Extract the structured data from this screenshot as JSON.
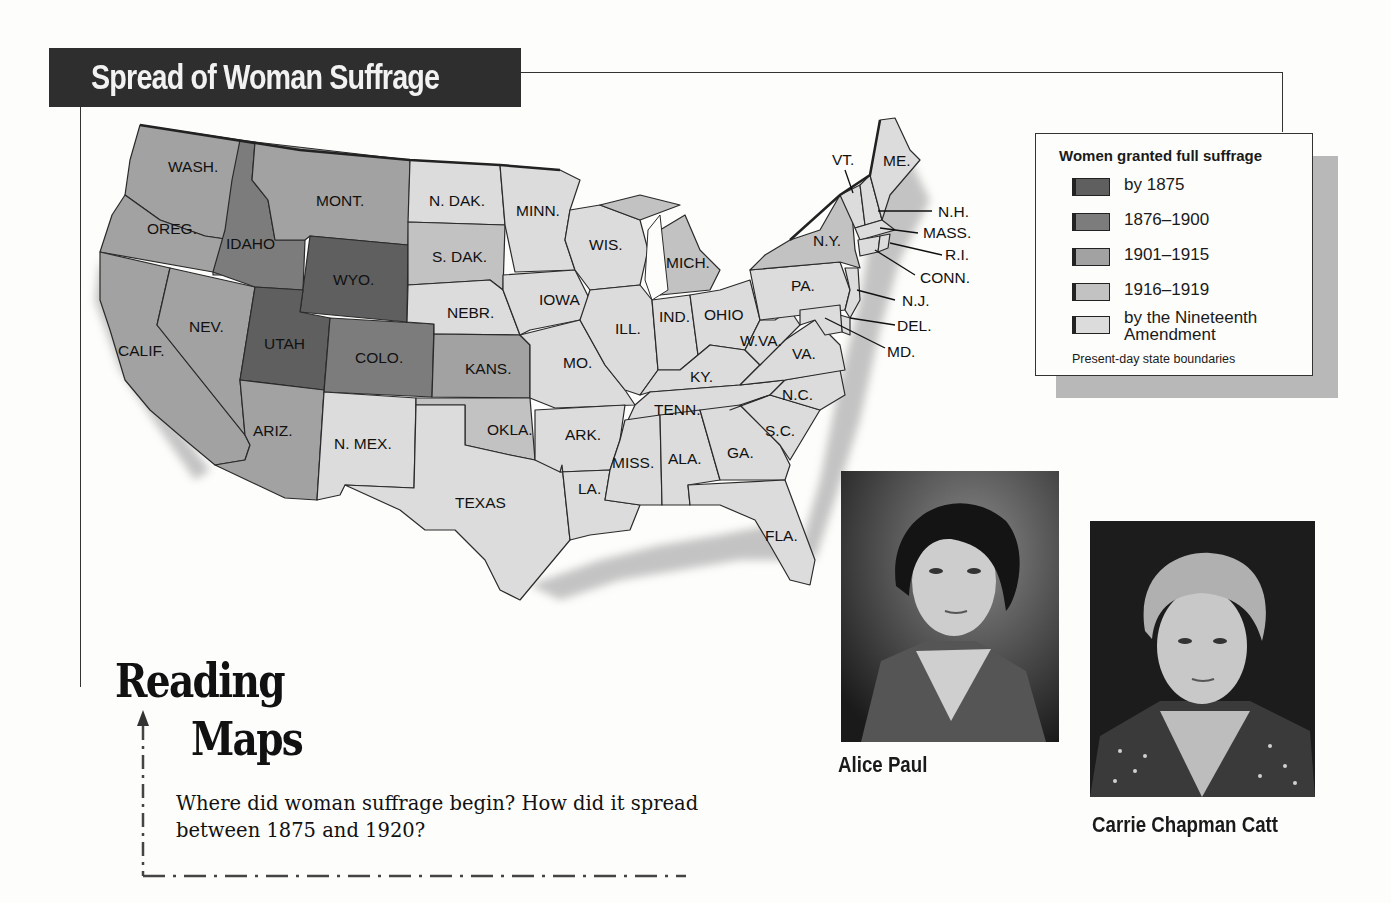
{
  "title": "Spread of Woman Suffrage",
  "legend": {
    "title": "Women granted full suffrage",
    "items": [
      {
        "label": "by 1875",
        "color": "#5f5f5f"
      },
      {
        "label": "1876–1900",
        "color": "#7c7c7c"
      },
      {
        "label": "1901–1915",
        "color": "#a2a2a2"
      },
      {
        "label": "1916–1919",
        "color": "#c2c2c2"
      },
      {
        "label": "by the Nineteenth Amendment",
        "color": "#dcdcdc"
      }
    ],
    "note": "Present-day state boundaries"
  },
  "map": {
    "states": [
      {
        "name": "WASH.",
        "category": "1901–1915"
      },
      {
        "name": "OREG.",
        "category": "1901–1915"
      },
      {
        "name": "CALIF.",
        "category": "1901–1915"
      },
      {
        "name": "IDAHO",
        "category": "1876–1900"
      },
      {
        "name": "NEV.",
        "category": "1901–1915"
      },
      {
        "name": "MONT.",
        "category": "1901–1915"
      },
      {
        "name": "WYO.",
        "category": "by 1875"
      },
      {
        "name": "UTAH",
        "category": "by 1875"
      },
      {
        "name": "COLO.",
        "category": "1876–1900"
      },
      {
        "name": "ARIZ.",
        "category": "1901–1915"
      },
      {
        "name": "N. MEX.",
        "category": "by the Nineteenth Amendment"
      },
      {
        "name": "N. DAK.",
        "category": "by the Nineteenth Amendment"
      },
      {
        "name": "S. DAK.",
        "category": "1916–1919"
      },
      {
        "name": "NEBR.",
        "category": "by the Nineteenth Amendment"
      },
      {
        "name": "KANS.",
        "category": "1901–1915"
      },
      {
        "name": "OKLA.",
        "category": "1916–1919"
      },
      {
        "name": "TEXAS",
        "category": "by the Nineteenth Amendment"
      },
      {
        "name": "MINN.",
        "category": "by the Nineteenth Amendment"
      },
      {
        "name": "IOWA",
        "category": "by the Nineteenth Amendment"
      },
      {
        "name": "MO.",
        "category": "by the Nineteenth Amendment"
      },
      {
        "name": "ARK.",
        "category": "by the Nineteenth Amendment"
      },
      {
        "name": "LA.",
        "category": "by the Nineteenth Amendment"
      },
      {
        "name": "WIS.",
        "category": "by the Nineteenth Amendment"
      },
      {
        "name": "ILL.",
        "category": "by the Nineteenth Amendment"
      },
      {
        "name": "MICH.",
        "category": "1916–1919"
      },
      {
        "name": "IND.",
        "category": "by the Nineteenth Amendment"
      },
      {
        "name": "OHIO",
        "category": "by the Nineteenth Amendment"
      },
      {
        "name": "KY.",
        "category": "by the Nineteenth Amendment"
      },
      {
        "name": "TENN.",
        "category": "by the Nineteenth Amendment"
      },
      {
        "name": "MISS.",
        "category": "by the Nineteenth Amendment"
      },
      {
        "name": "ALA.",
        "category": "by the Nineteenth Amendment"
      },
      {
        "name": "GA.",
        "category": "by the Nineteenth Amendment"
      },
      {
        "name": "FLA.",
        "category": "by the Nineteenth Amendment"
      },
      {
        "name": "S.C.",
        "category": "by the Nineteenth Amendment"
      },
      {
        "name": "N.C.",
        "category": "by the Nineteenth Amendment"
      },
      {
        "name": "VA.",
        "category": "by the Nineteenth Amendment"
      },
      {
        "name": "W.VA.",
        "category": "by the Nineteenth Amendment"
      },
      {
        "name": "PA.",
        "category": "by the Nineteenth Amendment"
      },
      {
        "name": "N.Y.",
        "category": "1916–1919"
      },
      {
        "name": "VT.",
        "category": "by the Nineteenth Amendment"
      },
      {
        "name": "ME.",
        "category": "by the Nineteenth Amendment"
      },
      {
        "name": "N.H.",
        "category": "by the Nineteenth Amendment"
      },
      {
        "name": "MASS.",
        "category": "by the Nineteenth Amendment"
      },
      {
        "name": "R.I.",
        "category": "by the Nineteenth Amendment"
      },
      {
        "name": "CONN.",
        "category": "by the Nineteenth Amendment"
      },
      {
        "name": "N.J.",
        "category": "by the Nineteenth Amendment"
      },
      {
        "name": "DEL.",
        "category": "by the Nineteenth Amendment"
      },
      {
        "name": "MD.",
        "category": "by the Nineteenth Amendment"
      }
    ]
  },
  "photos": [
    {
      "caption": "Alice Paul"
    },
    {
      "caption": "Carrie Chapman Catt"
    }
  ],
  "reading_maps": {
    "heading_line1": "Reading",
    "heading_line2": "Maps",
    "question": "Where did woman suffrage begin? How did it spread between 1875 and 1920?"
  }
}
